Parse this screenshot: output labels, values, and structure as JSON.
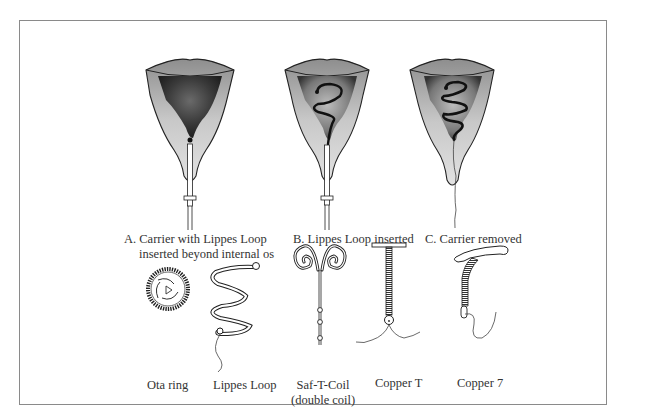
{
  "figure": {
    "top_row": {
      "panels": [
        {
          "id": "A",
          "label_line1": "A.  Carrier with Lippes Loop",
          "label_line2": "inserted beyond internal os"
        },
        {
          "id": "B",
          "label_line1": "B.  Lippes Loop inserted"
        },
        {
          "id": "C",
          "label_line1": "C.  Carrier removed"
        }
      ]
    },
    "bottom_row": {
      "devices": [
        {
          "name": "Ota ring"
        },
        {
          "name": "Lippes Loop"
        },
        {
          "name": "Saf-T-Coil",
          "subtitle": "(double coil)"
        },
        {
          "name": "Copper T"
        },
        {
          "name": "Copper 7"
        }
      ]
    },
    "colors": {
      "frame": "#8a8a8a",
      "ink": "#2a2a2a",
      "tissue_light": "#d9d9d9",
      "tissue_dark": "#4a4a4a"
    }
  }
}
